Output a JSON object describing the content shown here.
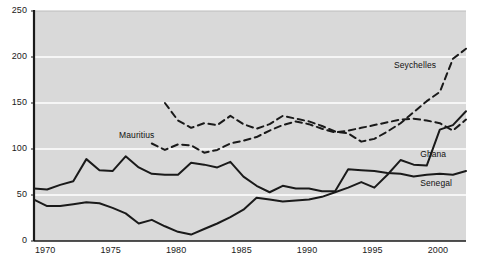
{
  "chart_data": {
    "type": "line",
    "title": "",
    "subtitle": "",
    "xlabel": "",
    "ylabel": "",
    "xlim": [
      1970,
      2003
    ],
    "ylim": [
      0,
      250
    ],
    "grid": true,
    "grid_axis": "y",
    "legend_position": "inline-annotations",
    "plot_background": "#d9d9d9",
    "line_color": "#1a1a1a",
    "gridline_color": "#ffffff",
    "y_ticks": [
      "0",
      "50",
      "100",
      "150",
      "200",
      "250"
    ],
    "y_tick_values": [
      0,
      50,
      100,
      150,
      200,
      250
    ],
    "x_ticks": [
      "1970",
      "1975",
      "1980",
      "1985",
      "1990",
      "1995",
      "2000"
    ],
    "x_tick_values": [
      1970,
      1975,
      1980,
      1985,
      1990,
      1995,
      2000
    ],
    "x": [
      1970,
      1971,
      1972,
      1973,
      1974,
      1975,
      1976,
      1977,
      1978,
      1979,
      1980,
      1981,
      1982,
      1983,
      1984,
      1985,
      1986,
      1987,
      1988,
      1989,
      1990,
      1991,
      1992,
      1993,
      1994,
      1995,
      1996,
      1997,
      1998,
      1999,
      2000,
      2001,
      2002,
      2003
    ],
    "series": [
      {
        "name": "Seychelles",
        "style": "dashed",
        "label_x": 1997.5,
        "label_y": 190,
        "x": [
          1980,
          1981,
          1982,
          1983,
          1984,
          1985,
          1986,
          1987,
          1988,
          1989,
          1990,
          1991,
          1992,
          1993,
          1994,
          1995,
          1996,
          1997,
          1998,
          1999,
          2000,
          2001,
          2002,
          2003
        ],
        "values": [
          150,
          131,
          123,
          128,
          126,
          136,
          127,
          122,
          127,
          136,
          133,
          130,
          125,
          119,
          117,
          108,
          111,
          119,
          128,
          140,
          152,
          162,
          198,
          209
        ]
      },
      {
        "name": "Mauritius",
        "style": "dashed",
        "label_x": 1976.5,
        "label_y": 114,
        "x": [
          1979,
          1980,
          1981,
          1982,
          1983,
          1984,
          1985,
          1986,
          1987,
          1988,
          1989,
          1990,
          1991,
          1992,
          1993,
          1994,
          1995,
          1996,
          1997,
          1998,
          1999,
          2000,
          2001,
          2002,
          2003
        ],
        "values": [
          106,
          99,
          105,
          104,
          96,
          99,
          106,
          109,
          113,
          120,
          126,
          130,
          127,
          122,
          118,
          120,
          123,
          126,
          129,
          132,
          133,
          131,
          128,
          120,
          132
        ]
      },
      {
        "name": "Ghana",
        "style": "solid",
        "label_x": 1999.5,
        "label_y": 93,
        "x": [
          1970,
          1971,
          1972,
          1973,
          1974,
          1975,
          1976,
          1977,
          1978,
          1979,
          1980,
          1981,
          1982,
          1983,
          1984,
          1985,
          1986,
          1987,
          1988,
          1989,
          1990,
          1991,
          1992,
          1993,
          1994,
          1995,
          1996,
          1997,
          1998,
          1999,
          2000,
          2001,
          2002,
          2003
        ],
        "values": [
          45,
          38,
          38,
          40,
          42,
          41,
          36,
          30,
          19,
          23,
          16,
          10,
          7,
          13,
          19,
          26,
          34,
          47,
          45,
          43,
          44,
          45,
          48,
          53,
          58,
          64,
          58,
          72,
          88,
          83,
          82,
          121,
          126,
          141
        ]
      },
      {
        "name": "Senegal",
        "style": "solid",
        "label_x": 1999.5,
        "label_y": 62,
        "x": [
          1970,
          1971,
          1972,
          1973,
          1974,
          1975,
          1976,
          1977,
          1978,
          1979,
          1980,
          1981,
          1982,
          1983,
          1984,
          1985,
          1986,
          1987,
          1988,
          1989,
          1990,
          1991,
          1992,
          1993,
          1994,
          1995,
          1996,
          1997,
          1998,
          1999,
          2000,
          2001,
          2002,
          2003
        ],
        "values": [
          57,
          56,
          61,
          65,
          89,
          77,
          76,
          92,
          80,
          73,
          72,
          72,
          85,
          83,
          80,
          86,
          70,
          60,
          53,
          60,
          57,
          57,
          54,
          54,
          78,
          77,
          76,
          74,
          73,
          70,
          72,
          73,
          72,
          76
        ]
      }
    ]
  }
}
